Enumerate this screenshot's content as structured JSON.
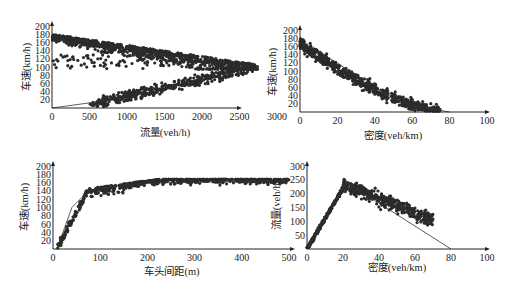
{
  "chart_data": [
    {
      "id": "flow-speed",
      "type": "scatter",
      "title": "",
      "xlabel": "流量(veh/h)",
      "ylabel": "车速(km/h)",
      "xlim": [
        0,
        3000
      ],
      "ylim": [
        0,
        200
      ],
      "xticks": [
        0,
        500,
        1000,
        1500,
        2000,
        2500,
        3000
      ],
      "yticks": [
        20,
        40,
        60,
        80,
        100,
        120,
        140,
        160,
        180,
        200
      ],
      "grid": false,
      "series": [
        {
          "name": "free-flow branch (speed 100-180, flow 0-2750)",
          "x_range": [
            0,
            2750
          ],
          "y_range": [
            100,
            178
          ]
        },
        {
          "name": "congested branch (speed 10-100, flow 550-2600)",
          "x_range": [
            550,
            2600
          ],
          "y_range": [
            10,
            100
          ]
        }
      ],
      "fit_line": {
        "x": [
          0,
          1500,
          2750
        ],
        "y": [
          180,
          155,
          105
        ],
        "note": "upper envelope"
      },
      "lower_line": {
        "x": [
          0,
          800
        ],
        "y": [
          0,
          20
        ]
      }
    },
    {
      "id": "density-speed",
      "type": "scatter",
      "title": "",
      "xlabel": "密度(veh/km)",
      "ylabel": "车速(km/h)",
      "xlim": [
        0,
        100
      ],
      "ylim": [
        0,
        200
      ],
      "xticks": [
        0,
        20,
        40,
        60,
        80,
        100
      ],
      "yticks": [
        20,
        40,
        60,
        80,
        100,
        120,
        140,
        160,
        180,
        200
      ],
      "grid": false,
      "series": [
        {
          "name": "observations",
          "x_range": [
            0,
            75
          ],
          "y_range": [
            5,
            175
          ]
        }
      ],
      "fit_line": {
        "x": [
          0,
          20,
          40,
          60,
          80
        ],
        "y": [
          170,
          120,
          55,
          15,
          0
        ]
      }
    },
    {
      "id": "spacing-speed",
      "type": "scatter",
      "title": "",
      "xlabel": "车头间距(m)",
      "ylabel": "车速(km/h)",
      "xlim": [
        0,
        500
      ],
      "ylim": [
        0,
        200
      ],
      "xticks": [
        0,
        100,
        200,
        300,
        400,
        500
      ],
      "yticks": [
        20,
        40,
        60,
        80,
        100,
        120,
        140,
        160,
        180,
        200
      ],
      "grid": false,
      "series": [
        {
          "name": "observations",
          "x_range": [
            10,
            500
          ],
          "y_range": [
            5,
            168
          ]
        }
      ],
      "fit_line": {
        "x": [
          10,
          40,
          75,
          150,
          250,
          500
        ],
        "y": [
          5,
          100,
          140,
          155,
          160,
          165
        ]
      }
    },
    {
      "id": "density-flow",
      "type": "scatter",
      "title": "",
      "xlabel": "密度(veh/km)",
      "ylabel": "流量(veh/h)",
      "xlim": [
        0,
        100
      ],
      "ylim": [
        0,
        300
      ],
      "xticks": [
        0,
        20,
        40,
        60,
        80,
        100
      ],
      "yticks": [
        50,
        100,
        150,
        200,
        250,
        300
      ],
      "grid": false,
      "series": [
        {
          "name": "observations",
          "x_range": [
            0,
            70
          ],
          "y_range": [
            5,
            265
          ]
        }
      ],
      "fit_line": {
        "x": [
          0,
          22,
          80
        ],
        "y": [
          0,
          240,
          0
        ]
      }
    }
  ],
  "labels": {
    "tl_x": "流量(veh/h)",
    "tl_y": "车速(km/h)",
    "tr_x": "密度(veh/km)",
    "tr_y": "车速(km/h)",
    "bl_x": "车头间距(m)",
    "bl_y": "车速(km/h)",
    "br_x": "密度(veh/km)",
    "br_y": "流量(veh/h)"
  },
  "colors": {
    "points": "#2b2b2b",
    "axis": "#222222",
    "line": "#333333"
  }
}
